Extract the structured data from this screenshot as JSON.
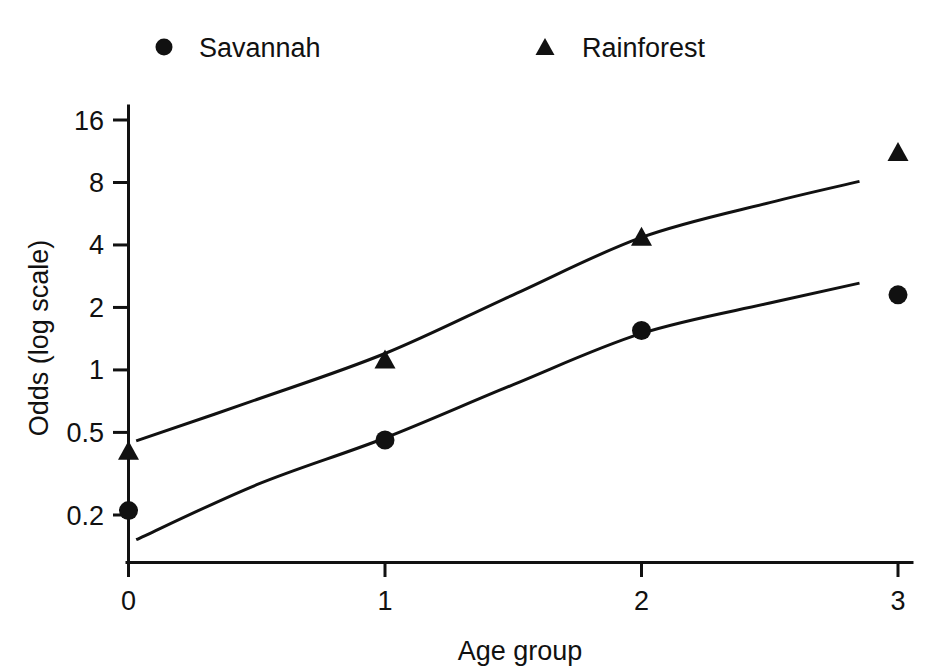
{
  "chart_data": {
    "type": "scatter",
    "title": "",
    "xlabel": "Age group",
    "ylabel": "Odds (log scale)",
    "x": [
      0,
      1,
      2,
      3
    ],
    "xticklabels": [
      "0",
      "1",
      "2",
      "3"
    ],
    "yticks": [
      0.2,
      0.5,
      1,
      2,
      4,
      8,
      16
    ],
    "yticklabels": [
      "0.2",
      "0.5",
      "1",
      "2",
      "4",
      "8",
      "16"
    ],
    "yscale": "log",
    "ylim": [
      0.13,
      20
    ],
    "xlim": [
      -0.1,
      3.1
    ],
    "grid": false,
    "legend_position": "top",
    "series": [
      {
        "name": "Savannah",
        "marker": "circle",
        "color": "#111111",
        "values": [
          0.21,
          0.46,
          1.55,
          2.3
        ],
        "fit_line": [
          {
            "x": 0.03,
            "y": 0.152
          },
          {
            "x": 0.5,
            "y": 0.28
          },
          {
            "x": 1.0,
            "y": 0.47
          },
          {
            "x": 1.5,
            "y": 0.85
          },
          {
            "x": 2.0,
            "y": 1.5
          },
          {
            "x": 2.5,
            "y": 2.1
          },
          {
            "x": 2.85,
            "y": 2.62
          }
        ]
      },
      {
        "name": "Rainforest",
        "marker": "triangle",
        "color": "#111111",
        "values": [
          0.4,
          1.1,
          4.3,
          11.0
        ],
        "fit_line": [
          {
            "x": 0.03,
            "y": 0.455
          },
          {
            "x": 0.5,
            "y": 0.72
          },
          {
            "x": 1.0,
            "y": 1.2
          },
          {
            "x": 1.5,
            "y": 2.3
          },
          {
            "x": 2.0,
            "y": 4.35
          },
          {
            "x": 2.5,
            "y": 6.4
          },
          {
            "x": 2.85,
            "y": 8.1
          }
        ]
      }
    ]
  },
  "legend": {
    "items": [
      {
        "label": "Savannah",
        "marker": "circle"
      },
      {
        "label": "Rainforest",
        "marker": "triangle"
      }
    ]
  },
  "axes": {
    "x_title": "Age group",
    "y_title": "Odds (log scale)"
  }
}
